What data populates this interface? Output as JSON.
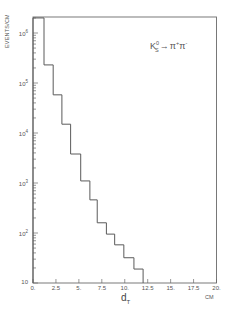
{
  "chart_data": {
    "type": "bar",
    "style": "step-histogram",
    "title": "",
    "annotation": "K_S^0 → π^+ π^-",
    "annotation_parts": {
      "particle": "K",
      "sup": "0",
      "sub": "S",
      "arrow": "→",
      "p1": "π",
      "p1sup": "+",
      "p2": "π",
      "p2sup": "-"
    },
    "xlabel": "d_T",
    "xlabel_main": "d",
    "xlabel_sub": "T",
    "xunit": "CM",
    "ylabel": "EVENTS/CM",
    "yscale": "log",
    "xlim": [
      0,
      20
    ],
    "ylim": [
      10,
      2000000
    ],
    "grid": false,
    "legend": "none",
    "x_ticks": [
      0,
      2.5,
      5,
      7.5,
      10,
      12.5,
      15,
      17.5,
      20
    ],
    "x_tick_labels": [
      "0.",
      "2.5",
      "5.",
      "7.5",
      "10.",
      "12.5",
      "15.",
      "17.5",
      "20."
    ],
    "y_ticks": [
      10,
      100,
      1000,
      10000,
      100000,
      1000000
    ],
    "y_tick_labels": [
      {
        "base": "10",
        "exp": ""
      },
      {
        "base": "10",
        "exp": "2"
      },
      {
        "base": "10",
        "exp": "3"
      },
      {
        "base": "10",
        "exp": "4"
      },
      {
        "base": "10",
        "exp": "5"
      },
      {
        "base": "10",
        "exp": "6"
      }
    ],
    "bin_edges": [
      0,
      1.2,
      2.2,
      3.15,
      4.1,
      5.2,
      6.2,
      7.0,
      8.0,
      8.9,
      9.9,
      11.0,
      12.0
    ],
    "values": [
      2000000,
      230000,
      58000,
      15000,
      3800,
      1100,
      460,
      160,
      95,
      58,
      32,
      19
    ]
  },
  "colors": {
    "line": "#5a5a5a",
    "frame": "#6a6a6a",
    "background": "#ffffff"
  }
}
